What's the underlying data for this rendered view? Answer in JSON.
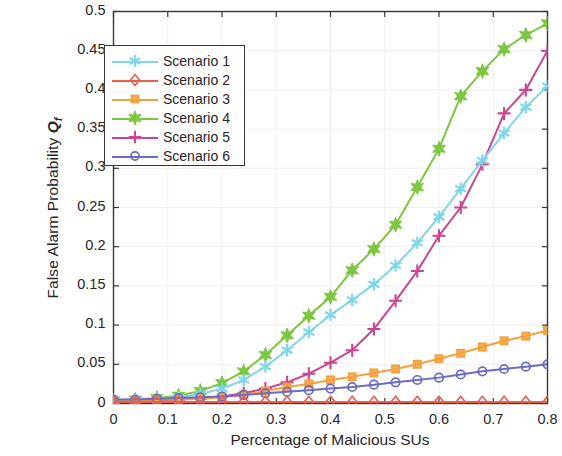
{
  "chart_data": {
    "type": "line",
    "title": "",
    "xlabel": "Percentage of Malicious SUs",
    "ylabel": "False Alarm Probability",
    "ylabel_symbol": "Q",
    "ylabel_symbol_sub": "f",
    "xlim": [
      0,
      0.8
    ],
    "ylim": [
      0,
      0.5
    ],
    "grid": true,
    "legend_position": "upper left",
    "xticks": [
      "0",
      "0.1",
      "0.2",
      "0.3",
      "0.4",
      "0.5",
      "0.6",
      "0.7",
      "0.8"
    ],
    "xtick_values": [
      0,
      0.1,
      0.2,
      0.3,
      0.4,
      0.5,
      0.6,
      0.7,
      0.8
    ],
    "yticks": [
      "0",
      "0.05",
      "0.1",
      "0.15",
      "0.2",
      "0.25",
      "0.3",
      "0.35",
      "0.4",
      "0.45",
      "0.5"
    ],
    "ytick_values": [
      0,
      0.05,
      0.1,
      0.15,
      0.2,
      0.25,
      0.3,
      0.35,
      0.4,
      0.45,
      0.5
    ],
    "x": [
      0,
      0.04,
      0.08,
      0.12,
      0.16,
      0.2,
      0.24,
      0.28,
      0.32,
      0.36,
      0.4,
      0.44,
      0.48,
      0.52,
      0.56,
      0.6,
      0.64,
      0.68,
      0.72,
      0.76,
      0.8
    ],
    "series": [
      {
        "name": "Scenario 1",
        "color": "#7FD6EA",
        "marker": "asterisk",
        "values": [
          0.004,
          0.005,
          0.006,
          0.008,
          0.012,
          0.019,
          0.03,
          0.047,
          0.068,
          0.091,
          0.113,
          0.132,
          0.152,
          0.176,
          0.205,
          0.238,
          0.274,
          0.31,
          0.345,
          0.378,
          0.405
        ]
      },
      {
        "name": "Scenario 2",
        "color": "#E8614E",
        "marker": "diamond",
        "values": [
          0.002,
          0.002,
          0.002,
          0.002,
          0.002,
          0.002,
          0.002,
          0.002,
          0.002,
          0.002,
          0.002,
          0.002,
          0.002,
          0.002,
          0.002,
          0.002,
          0.002,
          0.002,
          0.002,
          0.002,
          0.002
        ]
      },
      {
        "name": "Scenario 3",
        "color": "#F4A03E",
        "marker": "square",
        "values": [
          0.004,
          0.004,
          0.005,
          0.005,
          0.006,
          0.008,
          0.011,
          0.016,
          0.021,
          0.025,
          0.03,
          0.034,
          0.039,
          0.044,
          0.05,
          0.057,
          0.064,
          0.072,
          0.08,
          0.086,
          0.093
        ]
      },
      {
        "name": "Scenario 4",
        "color": "#7DC63F",
        "marker": "hexagram",
        "values": [
          0.004,
          0.005,
          0.007,
          0.01,
          0.016,
          0.026,
          0.041,
          0.062,
          0.087,
          0.112,
          0.136,
          0.17,
          0.197,
          0.228,
          0.276,
          0.325,
          0.392,
          0.424,
          0.452,
          0.47,
          0.485
        ]
      },
      {
        "name": "Scenario 5",
        "color": "#C9468E",
        "marker": "plus",
        "values": [
          0.003,
          0.003,
          0.004,
          0.005,
          0.006,
          0.009,
          0.013,
          0.019,
          0.027,
          0.038,
          0.052,
          0.068,
          0.095,
          0.131,
          0.169,
          0.214,
          0.25,
          0.305,
          0.37,
          0.4,
          0.45
        ]
      },
      {
        "name": "Scenario 6",
        "color": "#6B6BC6",
        "marker": "circle",
        "values": [
          0.005,
          0.005,
          0.006,
          0.007,
          0.008,
          0.009,
          0.011,
          0.013,
          0.015,
          0.017,
          0.019,
          0.021,
          0.024,
          0.027,
          0.03,
          0.033,
          0.037,
          0.041,
          0.044,
          0.047,
          0.05
        ]
      }
    ]
  },
  "legend": {
    "items": [
      {
        "label": "Scenario 1"
      },
      {
        "label": "Scenario 2"
      },
      {
        "label": "Scenario 3"
      },
      {
        "label": "Scenario 4"
      },
      {
        "label": "Scenario 5"
      },
      {
        "label": "Scenario 6"
      }
    ]
  }
}
